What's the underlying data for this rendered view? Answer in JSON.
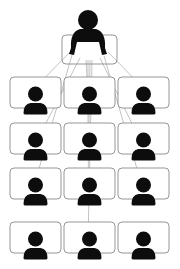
{
  "diagram": {
    "type": "hierarchy",
    "description": "One supervisor at a desk connected to twelve team members in a 4x3 grid",
    "colors": {
      "icon": "#0d0d0d",
      "box_stroke": "#8a8a8a",
      "line": "#9a9a9a",
      "background": "#ffffff"
    },
    "root": {
      "label": "supervisor",
      "icon": "person-at-desk-icon",
      "head": {
        "cx": 88,
        "cy": 20,
        "r": 10
      },
      "desk": {
        "x": 62,
        "y": 35,
        "w": 55,
        "h": 29
      }
    },
    "grid": {
      "rows": 4,
      "cols": 3,
      "col_x": [
        10,
        64,
        118
      ],
      "row_y": [
        77,
        123,
        168,
        222
      ],
      "box_w": 51,
      "box_h": 31
    },
    "members": [
      {
        "row": 0,
        "col": 0,
        "icon": "person-icon"
      },
      {
        "row": 0,
        "col": 1,
        "icon": "person-icon"
      },
      {
        "row": 0,
        "col": 2,
        "icon": "person-icon"
      },
      {
        "row": 1,
        "col": 0,
        "icon": "person-icon"
      },
      {
        "row": 1,
        "col": 1,
        "icon": "person-icon"
      },
      {
        "row": 1,
        "col": 2,
        "icon": "person-icon"
      },
      {
        "row": 2,
        "col": 0,
        "icon": "person-icon"
      },
      {
        "row": 2,
        "col": 1,
        "icon": "person-icon"
      },
      {
        "row": 2,
        "col": 2,
        "icon": "person-icon"
      },
      {
        "row": 3,
        "col": 0,
        "icon": "person-icon"
      },
      {
        "row": 3,
        "col": 1,
        "icon": "person-icon"
      },
      {
        "row": 3,
        "col": 2,
        "icon": "person-icon"
      }
    ],
    "connections": [
      {
        "from": [
          70,
          52
        ],
        "to": [
          28,
          95
        ]
      },
      {
        "from": [
          72,
          55
        ],
        "to": [
          34,
          186
        ]
      },
      {
        "from": [
          80,
          58
        ],
        "to": [
          37,
          140
        ]
      },
      {
        "from": [
          86,
          60
        ],
        "to": [
          88,
          95
        ]
      },
      {
        "from": [
          88,
          60
        ],
        "to": [
          88,
          140
        ]
      },
      {
        "from": [
          90,
          60
        ],
        "to": [
          88,
          186
        ]
      },
      {
        "from": [
          92,
          60
        ],
        "to": [
          88,
          240
        ]
      },
      {
        "from": [
          100,
          58
        ],
        "to": [
          140,
          140
        ]
      },
      {
        "from": [
          104,
          56
        ],
        "to": [
          142,
          186
        ]
      },
      {
        "from": [
          108,
          52
        ],
        "to": [
          150,
          95
        ]
      }
    ]
  }
}
